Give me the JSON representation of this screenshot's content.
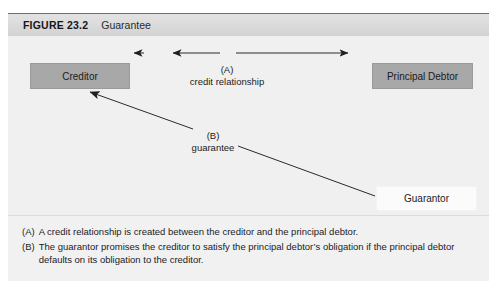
{
  "figure": {
    "number": "FIGURE 23.2",
    "title": "Guarantee"
  },
  "diagram": {
    "nodes": [
      {
        "id": "creditor",
        "label": "Creditor",
        "style": "shaded"
      },
      {
        "id": "principal_debtor",
        "label": "Principal Debtor",
        "style": "shaded"
      },
      {
        "id": "guarantor",
        "label": "Guarantor",
        "style": "plain"
      }
    ],
    "edges": [
      {
        "id": "a",
        "marker": "(A)",
        "label": "credit relationship",
        "from": "creditor",
        "to": "principal_debtor",
        "direction": "both"
      },
      {
        "id": "b",
        "marker": "(B)",
        "label": "guarantee",
        "from": "guarantor",
        "to": "creditor",
        "direction": "to-creditor"
      }
    ]
  },
  "caption": {
    "lines": [
      {
        "marker": "(A)",
        "text": "A credit relationship is created between the creditor and the principal debtor."
      },
      {
        "marker": "(B)",
        "text": "The guarantor promises the creditor to satisfy the principal debtor’s obligation if the principal debtor defaults on its obligation to the creditor."
      }
    ]
  },
  "colors": {
    "node_shaded": "#a8a8a8",
    "node_plain": "#fbfbfb",
    "canvas": "#f0f0f0",
    "header": "#dcdcdc",
    "line": "#2a2a2c"
  }
}
